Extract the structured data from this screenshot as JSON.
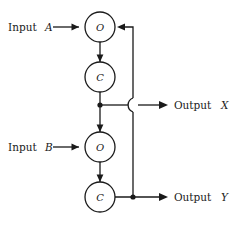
{
  "diagram": {
    "type": "block-flow-diagram",
    "background_color": "#ffffff",
    "line_color": "#1a1a1a",
    "nodes": [
      {
        "id": "o1",
        "label": "O",
        "cx": 100,
        "cy": 27,
        "r": 15
      },
      {
        "id": "c1",
        "label": "C",
        "cx": 100,
        "cy": 77,
        "r": 15
      },
      {
        "id": "o2",
        "label": "O",
        "cx": 100,
        "cy": 147,
        "r": 15
      },
      {
        "id": "c2",
        "label": "C",
        "cx": 100,
        "cy": 197,
        "r": 15
      }
    ],
    "inputs": [
      {
        "id": "input-a",
        "text": "Input",
        "variable": "A",
        "target": "o1"
      },
      {
        "id": "input-b",
        "text": "Input",
        "variable": "B",
        "target": "o2"
      }
    ],
    "outputs": [
      {
        "id": "output-x",
        "text": "Output",
        "variable": "X",
        "source": "c1"
      },
      {
        "id": "output-y",
        "text": "Output",
        "variable": "Y",
        "source": "c2"
      }
    ],
    "feedback": {
      "id": "feedback-path",
      "from": "output-y-line",
      "to": "o1",
      "crossing_style": "hop"
    },
    "junctions": [
      {
        "id": "junction-x",
        "x": 100,
        "y": 105
      },
      {
        "id": "junction-y",
        "x": 133,
        "y": 197
      }
    ],
    "caption_remnant": ""
  }
}
